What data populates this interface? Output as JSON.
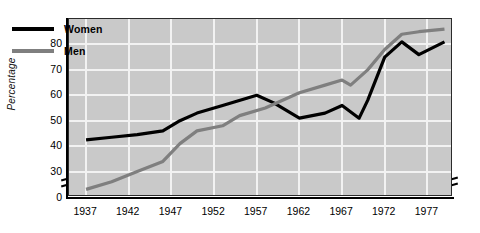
{
  "chart_data": {
    "type": "line",
    "title": "",
    "subtitle": "",
    "xlabel": "",
    "ylabel": "Percentage",
    "xlim": [
      1935,
      1980
    ],
    "ylim": [
      20,
      90
    ],
    "y_axis_break": true,
    "x_axis_break": true,
    "grid": true,
    "legend_position": "top-left",
    "xticks": [
      1937,
      1942,
      1947,
      1952,
      1957,
      1962,
      1967,
      1972,
      1977
    ],
    "xtick_labels": [
      "1937",
      "1942",
      "1947",
      "1952",
      "1957",
      "1962",
      "1967",
      "1972",
      "1977"
    ],
    "yticks": [
      0,
      30,
      40,
      50,
      60,
      70,
      80
    ],
    "ytick_labels": [
      "0",
      "30",
      "40",
      "50",
      "60",
      "70",
      "80"
    ],
    "series": [
      {
        "name": "Women",
        "color": "#000000",
        "x": [
          1937,
          1940,
          1943,
          1946,
          1948,
          1950,
          1953,
          1957,
          1959,
          1962,
          1965,
          1967,
          1969,
          1970,
          1972,
          1974,
          1976,
          1979
        ],
        "values": [
          42.5,
          43.5,
          44.5,
          46,
          50,
          53,
          56,
          60,
          57,
          51,
          53,
          56,
          51,
          58,
          75,
          81,
          76,
          81
        ]
      },
      {
        "name": "Men",
        "color": "#7f7f7f",
        "x": [
          1937,
          1940,
          1943,
          1946,
          1948,
          1950,
          1953,
          1955,
          1958,
          1962,
          1965,
          1967,
          1968,
          1970,
          1972,
          1974,
          1976,
          1979
        ],
        "values": [
          23,
          26,
          30,
          34,
          41,
          46,
          48,
          52,
          55,
          61,
          64,
          66,
          64,
          70,
          78,
          84,
          85,
          86
        ]
      }
    ]
  },
  "legend": {
    "items": [
      {
        "label": "Women",
        "color": "#000000"
      },
      {
        "label": "Men",
        "color": "#7f7f7f"
      }
    ]
  },
  "axes": {
    "y_title": "Percentage"
  }
}
